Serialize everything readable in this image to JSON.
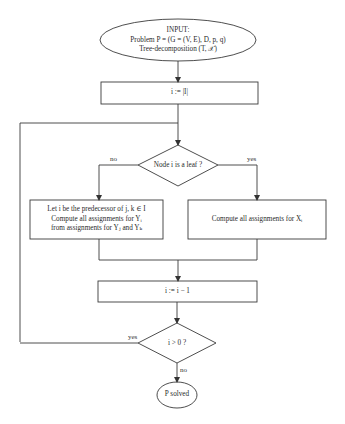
{
  "diagram": {
    "type": "flowchart",
    "nodes": {
      "input": {
        "shape": "ellipse",
        "lines": [
          "INPUT:",
          "Problem P = (G = (V, E), D, p, q)",
          "Tree-decomposition (T, 𝒳)"
        ]
      },
      "init": {
        "shape": "rect",
        "text": "i := |I|"
      },
      "leaf_check": {
        "shape": "diamond",
        "text": "Node i is a leaf ?"
      },
      "inner_compute": {
        "shape": "rect",
        "lines": [
          "Let i be the predecessor of j, k ∈ I",
          "Compute all assignments for Yᵢ",
          "from assignments for Yⱼ and Yₖ"
        ]
      },
      "leaf_compute": {
        "shape": "rect",
        "text": "Compute all assignments for Xᵢ"
      },
      "decrement": {
        "shape": "rect",
        "text": "i := i − 1"
      },
      "loop_check": {
        "shape": "diamond",
        "text": "i > 0 ?"
      },
      "end": {
        "shape": "ellipse",
        "text": "P solved"
      }
    },
    "edge_labels": {
      "leaf_no": "no",
      "leaf_yes": "yes",
      "loop_yes": "yes",
      "loop_no": "no"
    },
    "colors": {
      "stroke": "#3a3a3a",
      "background": "#ffffff",
      "text": "#2a2a2a"
    }
  }
}
